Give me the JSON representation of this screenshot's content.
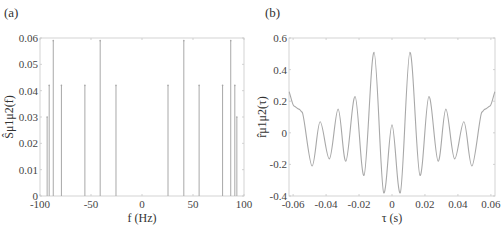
{
  "chart_data": [
    {
      "panel": "(a)",
      "type": "stem",
      "title": "",
      "xlabel": "f (Hz)",
      "ylabel": "Ŝμ1μ2(f)",
      "xlim": [
        -100,
        100
      ],
      "ylim": [
        0,
        0.06
      ],
      "xticks": [
        -100,
        -50,
        0,
        50,
        100
      ],
      "xtick_labels": [
        "-100",
        "-50",
        "0",
        "50",
        "100"
      ],
      "yticks": [
        0,
        0.01,
        0.02,
        0.03,
        0.04,
        0.05,
        0.06
      ],
      "ytick_labels": [
        "0",
        "0.01",
        "0.02",
        "0.03",
        "0.04",
        "0.05",
        "0.06"
      ],
      "grid": false,
      "x": [
        -93,
        -91,
        -87,
        -79,
        -56,
        -41,
        -25.5,
        25.5,
        41,
        56,
        79,
        87,
        91,
        93
      ],
      "values": [
        0.03,
        0.042,
        0.059,
        0.042,
        0.042,
        0.059,
        0.042,
        0.042,
        0.059,
        0.042,
        0.042,
        0.059,
        0.042,
        0.03
      ]
    },
    {
      "panel": "(b)",
      "type": "line",
      "title": "",
      "xlabel": "τ (s)",
      "ylabel": "r̂μ1μ2(τ)",
      "xlim": [
        -0.0625,
        0.0625
      ],
      "ylim": [
        -0.4,
        0.6
      ],
      "xticks": [
        -0.06,
        -0.04,
        -0.02,
        0,
        0.02,
        0.04,
        0.06
      ],
      "xtick_labels": [
        "-0.06",
        "-0.04",
        "-0.02",
        "0",
        "0.02",
        "0.04",
        "0.06"
      ],
      "yticks": [
        -0.4,
        -0.2,
        0,
        0.2,
        0.4,
        0.6
      ],
      "ytick_labels": [
        "-0.4",
        "-0.2",
        "0",
        "0.2",
        "0.4",
        "0.6"
      ],
      "grid": false,
      "x": [
        -0.0625,
        -0.0595,
        -0.0565,
        -0.0545,
        -0.0485,
        -0.0436,
        -0.038,
        -0.0327,
        -0.028,
        -0.0224,
        -0.017,
        -0.0109,
        -0.005,
        0.0,
        0.005,
        0.0109,
        0.017,
        0.0224,
        0.028,
        0.0327,
        0.038,
        0.0436,
        0.0485,
        0.0545,
        0.0565,
        0.0595,
        0.0625
      ],
      "values": [
        0.26,
        0.17,
        0.15,
        0.13,
        -0.21,
        0.07,
        -0.165,
        0.15,
        -0.18,
        0.23,
        -0.27,
        0.51,
        -0.38,
        0.05,
        -0.38,
        0.51,
        -0.27,
        0.23,
        -0.18,
        0.15,
        -0.165,
        0.07,
        -0.21,
        0.13,
        0.15,
        0.17,
        0.26
      ]
    }
  ]
}
